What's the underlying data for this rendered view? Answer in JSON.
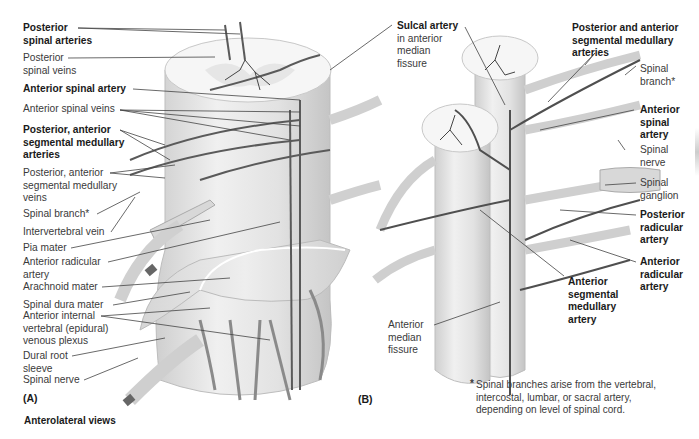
{
  "panel_a": {
    "tag": "(A)",
    "labels": [
      {
        "id": "posterior-spinal-arteries",
        "lines": [
          "Posterior",
          "spinal arteries"
        ],
        "bold": true
      },
      {
        "id": "posterior-spinal-veins",
        "lines": [
          "Posterior",
          "spinal veins"
        ],
        "bold": false
      },
      {
        "id": "anterior-spinal-artery",
        "lines": [
          "Anterior spinal artery"
        ],
        "bold": true
      },
      {
        "id": "anterior-spinal-veins",
        "lines": [
          "Anterior spinal veins"
        ],
        "bold": false
      },
      {
        "id": "posterior-anterior-segmental-medullary-arteries",
        "lines": [
          "Posterior, anterior",
          "segmental medullary",
          "arteries"
        ],
        "bold": true
      },
      {
        "id": "posterior-anterior-segmental-medullary-veins",
        "lines": [
          "Posterior, anterior",
          "segmental medullary",
          "veins"
        ],
        "bold": false
      },
      {
        "id": "spinal-branch",
        "lines": [
          "Spinal branch*"
        ],
        "bold": false
      },
      {
        "id": "intervertebral-vein",
        "lines": [
          "Intervertebral vein"
        ],
        "bold": false
      },
      {
        "id": "pia-mater",
        "lines": [
          "Pia mater"
        ],
        "bold": false
      },
      {
        "id": "anterior-radicular-artery",
        "lines": [
          "Anterior radicular",
          "artery"
        ],
        "bold": false
      },
      {
        "id": "arachnoid-mater",
        "lines": [
          "Arachnoid mater"
        ],
        "bold": false
      },
      {
        "id": "spinal-dura-mater",
        "lines": [
          "Spinal dura mater"
        ],
        "bold": false
      },
      {
        "id": "anterior-internal-vertebral-venous-plexus",
        "lines": [
          "Anterior internal",
          "vertebral (epidural)",
          "venous plexus"
        ],
        "bold": false
      },
      {
        "id": "dural-root-sleeve",
        "lines": [
          "Dural root",
          "sleeve"
        ],
        "bold": false
      },
      {
        "id": "spinal-nerve",
        "lines": [
          "Spinal nerve"
        ],
        "bold": false
      }
    ],
    "caption": "Anterolateral views"
  },
  "panel_b": {
    "tag": "(B)",
    "labels": [
      {
        "id": "sulcal-artery",
        "lines": [
          "Sulcal artery",
          "in anterior",
          "median",
          "fissure"
        ],
        "bold_first_line": true
      },
      {
        "id": "posterior-and-anterior-segmental-medullary-arteries",
        "lines": [
          "Posterior and anterior",
          "segmental medullary",
          "arteries"
        ],
        "bold": true
      },
      {
        "id": "spinal-branch",
        "lines": [
          "Spinal",
          "branch*"
        ],
        "bold": false
      },
      {
        "id": "anterior-spinal-artery",
        "lines": [
          "Anterior",
          "spinal",
          "artery"
        ],
        "bold": true
      },
      {
        "id": "spinal-nerve",
        "lines": [
          "Spinal",
          "nerve"
        ],
        "bold": false
      },
      {
        "id": "spinal-ganglion",
        "lines": [
          "Spinal",
          "ganglion"
        ],
        "bold": false
      },
      {
        "id": "posterior-radicular-artery",
        "lines": [
          "Posterior",
          "radicular",
          "artery"
        ],
        "bold": true
      },
      {
        "id": "anterior-radicular-artery",
        "lines": [
          "Anterior",
          "radicular",
          "artery"
        ],
        "bold": true
      },
      {
        "id": "anterior-segmental-medullary-artery",
        "lines": [
          "Anterior",
          "segmental",
          "medullary",
          "artery"
        ],
        "bold": true
      },
      {
        "id": "anterior-median-fissure",
        "lines": [
          "Anterior",
          "median",
          "fissure"
        ],
        "bold": false
      }
    ]
  },
  "footnote": {
    "marker": "*",
    "lines": [
      "Spinal branches arise from the vertebral,",
      "intercostal, lumbar, or sacral artery,",
      "depending on level of spinal cord."
    ]
  },
  "colors": {
    "artery": "#555555",
    "vessel_light": "#9a9a9a",
    "tissue": "#e6e6e6",
    "leader": "#444444"
  }
}
